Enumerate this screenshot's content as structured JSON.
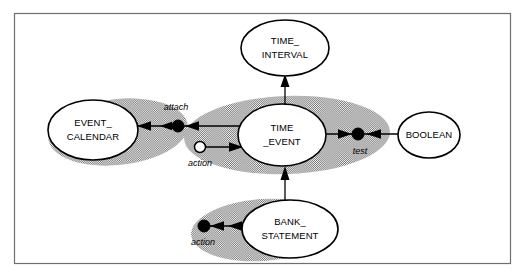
{
  "figure": {
    "background_color": "#ffffff",
    "frame_color": "#6f6f6f",
    "shade_color": "#9a9a9a",
    "line_color": "#000000",
    "width": 525,
    "height": 278
  },
  "entities": {
    "event_calendar": {
      "label_line1": "EVENT_",
      "label_line2": "CALENDAR",
      "cx": 93,
      "cy": 130,
      "rx": 45,
      "ry": 30
    },
    "time_event": {
      "label_line1": "TIME",
      "label_line2": "_EVENT",
      "cx": 282,
      "cy": 135,
      "rx": 44,
      "ry": 31
    },
    "time_interval": {
      "label_line1": "TIME_",
      "label_line2": "INTERVAL",
      "cx": 285,
      "cy": 48,
      "rx": 44,
      "ry": 28
    },
    "boolean": {
      "label_line1": "BOOLEAN",
      "label_line2": "",
      "cx": 429,
      "cy": 135,
      "rx": 31,
      "ry": 23
    },
    "bank_statement": {
      "label_line1": "BANK_",
      "label_line2": "STATEMENT",
      "cx": 290,
      "cy": 229,
      "rx": 48,
      "ry": 29
    }
  },
  "relationships": {
    "attach": {
      "label": "attach",
      "label_x": 176,
      "label_y": 108,
      "dot_x": 178,
      "dot_y": 126,
      "dot_type": "filled"
    },
    "action_calendar": {
      "label": "action",
      "label_x": 200,
      "label_y": 164,
      "dot_x": 200,
      "dot_y": 147,
      "dot_type": "hollow"
    },
    "test": {
      "label": "test",
      "label_x": 360,
      "label_y": 152,
      "dot_x": 358,
      "dot_y": 134,
      "dot_type": "filled"
    },
    "action_bank": {
      "label": "action",
      "label_x": 203,
      "label_y": 243,
      "dot_x": 204,
      "dot_y": 226,
      "dot_type": "filled"
    }
  },
  "shaded_regions": [
    {
      "name": "event-calendar-group",
      "cx": 118,
      "cy": 132,
      "rx": 70,
      "ry": 33,
      "rotate": -6
    },
    {
      "name": "time-event-group",
      "cx": 287,
      "cy": 135,
      "rx": 103,
      "ry": 39,
      "rotate": -2
    },
    {
      "name": "bank-statement-group",
      "cx": 263,
      "cy": 230,
      "rx": 72,
      "ry": 31,
      "rotate": -4
    }
  ],
  "edges": [
    {
      "name": "time-event-to-time-interval",
      "direction": "up"
    },
    {
      "name": "bank-statement-to-time-event",
      "direction": "up"
    },
    {
      "name": "time-event-to-event-calendar",
      "direction": "left"
    },
    {
      "name": "action-to-time-event",
      "direction": "right"
    },
    {
      "name": "time-event-to-boolean",
      "direction": "right"
    },
    {
      "name": "boolean-to-test",
      "direction": "left"
    },
    {
      "name": "action-to-bank-statement",
      "direction": "left"
    }
  ]
}
